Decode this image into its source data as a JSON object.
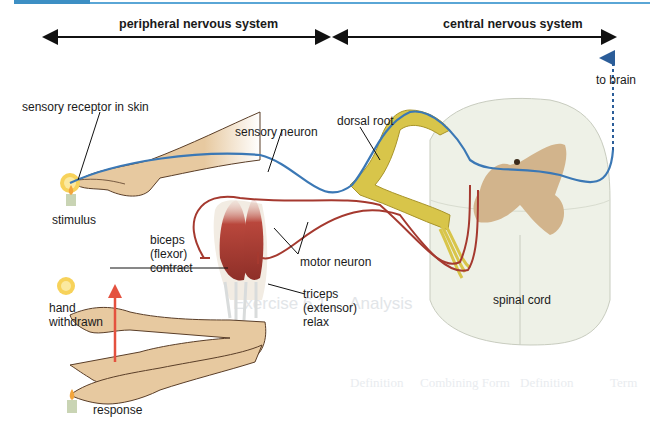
{
  "figure": {
    "regions": {
      "peripheral": "peripheral nervous system",
      "central": "central nervous system"
    },
    "labels": {
      "sensory_receptor": "sensory receptor in skin",
      "sensory_neuron": "sensory neuron",
      "dorsal_root": "dorsal root",
      "to_brain": "to brain",
      "stimulus": "stimulus",
      "biceps_1": "biceps",
      "biceps_2": "(flexor)",
      "biceps_3": "contract",
      "motor_neuron": "motor neuron",
      "triceps_1": "triceps",
      "triceps_2": "(extensor)",
      "triceps_3": "relax",
      "hand_1": "hand",
      "hand_2": "withdrawn",
      "response": "response",
      "spinal_cord": "spinal cord"
    },
    "colors": {
      "header_accent": "#3d8fc4",
      "sensory_neuron": "#3b78b5",
      "motor_neuron": "#a5392f",
      "response_arrow": "#e4513f",
      "skin": "#e7c9a0",
      "muscle": "#b9473c",
      "nerve": "#d8c54a",
      "grey_matter": "#d2b48c",
      "white_matter": "#ecefe4"
    }
  },
  "background_bleed": {
    "heading": "Exercise 6.1 ... Analysis",
    "columns": [
      "Definition",
      "Combining Form",
      "Definition",
      "Term"
    ]
  }
}
